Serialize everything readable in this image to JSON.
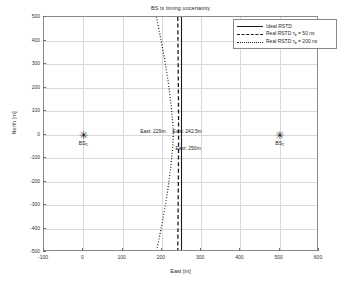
{
  "chart_data": {
    "type": "line",
    "title": "BS tx timing uncertainty",
    "xlabel": "East [m]",
    "ylabel": "North [m]",
    "xlim": [
      -100,
      600
    ],
    "ylim": [
      -500,
      500
    ],
    "xticks": [
      "-100",
      "0",
      "100",
      "200",
      "300",
      "400",
      "500",
      "600"
    ],
    "yticks": [
      "500",
      "400",
      "300",
      "200",
      "100",
      "0",
      "-100",
      "-200",
      "-300",
      "-400",
      "-500"
    ],
    "grid": true,
    "legend_position": "top-right",
    "series": [
      {
        "name": "Ideal RSTD",
        "style": "solid",
        "color": "#1a1a1a",
        "points": [
          {
            "x": 250,
            "y": 500
          },
          {
            "x": 250,
            "y": 400
          },
          {
            "x": 250,
            "y": 300
          },
          {
            "x": 250,
            "y": 200
          },
          {
            "x": 250,
            "y": 100
          },
          {
            "x": 250,
            "y": 0
          },
          {
            "x": 250,
            "y": -100
          },
          {
            "x": 250,
            "y": -200
          },
          {
            "x": 250,
            "y": -300
          },
          {
            "x": 250,
            "y": -400
          },
          {
            "x": 250,
            "y": -500
          }
        ]
      },
      {
        "name": "Real RSTD tau_b = 50 ns",
        "style": "dashed",
        "color": "#1a1a1a",
        "points": [
          {
            "x": 240.5,
            "y": 500
          },
          {
            "x": 241.0,
            "y": 400
          },
          {
            "x": 241.5,
            "y": 300
          },
          {
            "x": 242.0,
            "y": 200
          },
          {
            "x": 242.4,
            "y": 100
          },
          {
            "x": 242.5,
            "y": 0
          },
          {
            "x": 242.4,
            "y": -100
          },
          {
            "x": 242.0,
            "y": -200
          },
          {
            "x": 241.5,
            "y": -300
          },
          {
            "x": 241.0,
            "y": -400
          },
          {
            "x": 240.5,
            "y": -500
          }
        ]
      },
      {
        "name": "Real RSTD tau_b = 200 ns",
        "style": "dotted",
        "color": "#1a1a1a",
        "points": [
          {
            "x": 186,
            "y": 500
          },
          {
            "x": 198,
            "y": 400
          },
          {
            "x": 209,
            "y": 300
          },
          {
            "x": 218,
            "y": 200
          },
          {
            "x": 225,
            "y": 100
          },
          {
            "x": 229,
            "y": 0
          },
          {
            "x": 225,
            "y": -100
          },
          {
            "x": 218,
            "y": -200
          },
          {
            "x": 209,
            "y": -300
          },
          {
            "x": 198,
            "y": -400
          },
          {
            "x": 186,
            "y": -500
          }
        ]
      }
    ],
    "markers": [
      {
        "label": "BS",
        "sub": "1",
        "x": 0,
        "y": 0,
        "glyph": "✳"
      },
      {
        "label": "BS",
        "sub": "2",
        "x": 500,
        "y": 0,
        "glyph": "✳"
      }
    ],
    "annotations": [
      {
        "text": "East: 229m",
        "x": 229,
        "y": 0
      },
      {
        "text": "East: 242.5m",
        "x": 242.5,
        "y": 0
      },
      {
        "text": "East: 250m",
        "x": 250,
        "y": -60
      }
    ]
  },
  "legend": {
    "items": [
      {
        "label": "Ideal RSTD",
        "style": "solid",
        "sub": "",
        "suffix": ""
      },
      {
        "label": "Real RSTD τ",
        "style": "dashed",
        "sub": "b",
        "suffix": " = 50 ns"
      },
      {
        "label": "Real RSTD τ",
        "style": "dotted",
        "sub": "b",
        "suffix": " = 200 ns"
      }
    ]
  }
}
